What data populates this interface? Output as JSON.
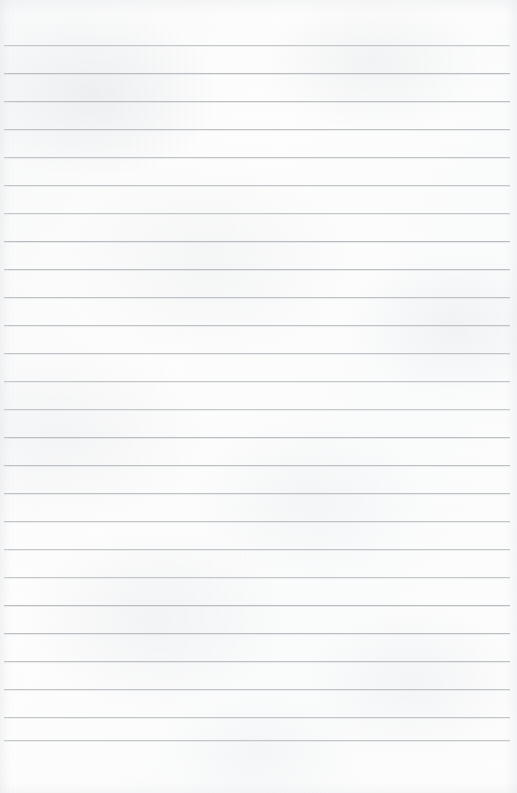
{
  "document": {
    "kind": "ruled-notebook-paper",
    "title": "Ruled notebook paper",
    "page_width": 517,
    "page_height": 793,
    "has_written_content": false,
    "has_margin_rule": false,
    "body_text": ""
  },
  "paper": {
    "background_color": "#fdfdfd",
    "texture_tint": "#eceef0",
    "edge_shadow_color": "#e2e4e7"
  },
  "rules": {
    "line_color": "#b9bdc1",
    "line_thickness_px": 1,
    "spacing_px": 28,
    "left_x": 4,
    "right_x": 510,
    "first_line_y": 45,
    "count": 25,
    "positions_y": [
      45,
      73,
      101,
      129,
      157,
      185,
      213,
      241,
      269,
      297,
      325,
      353,
      381,
      409,
      437,
      465,
      493,
      521,
      549,
      577,
      605,
      633,
      661,
      689,
      717,
      740
    ]
  }
}
